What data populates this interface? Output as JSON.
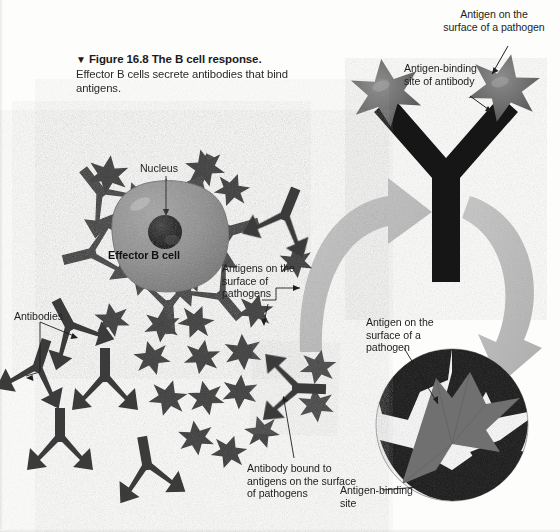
{
  "figure": {
    "marker": "▼",
    "number": "Figure 16.8",
    "title": "The B cell response.",
    "subtitle": "Effector B cells secrete antibodies that bind antigens."
  },
  "labels": {
    "nucleus": "Nucleus",
    "effector_b_cell": "Effector B cell",
    "antigens_on_surface_of_pathogens": "Antigens on the surface of pathogens",
    "antibodies": "Antibodies",
    "antibody_bound": "Antibody bound to antigens on the surface of pathogens",
    "antigen_on_surface_top": "Antigen on the surface of a pathogen",
    "antigen_binding_site_of_antibody": "Antigen-binding site of antibody",
    "antigen_on_surface_bottom": "Antigen on the surface of a pathogen",
    "antigen_binding_site": "Antigen-binding site"
  },
  "colors": {
    "background": "#fdfdfc",
    "antibody_dark": "#3a3a3a",
    "antibody_black": "#141414",
    "antigen_star_dark": "#3d3d3d",
    "antigen_star_gray": "#6e6e6e",
    "cell_body": "#8d8d8d",
    "cell_nucleus": "#1a1a1a",
    "arrow_gray": "#b9b9b9",
    "leader_line": "#1e1e1e",
    "text": "#1e1e1e"
  },
  "diagram": {
    "type": "biology-illustration",
    "panels": [
      {
        "name": "cell-panel",
        "description": "Effector B cell secreting antibodies among pathogen antigens"
      },
      {
        "name": "antibody-detail-panel",
        "description": "Enlarged Y-shaped antibody with two antigens bound at its tips"
      },
      {
        "name": "binding-site-panel",
        "description": "Circular magnification of an antigen-binding site"
      }
    ],
    "antigen_stars": [
      {
        "cx": 108,
        "cy": 175,
        "r": 20,
        "shade": "dark"
      },
      {
        "cx": 205,
        "cy": 168,
        "r": 19,
        "shade": "dark"
      },
      {
        "cx": 232,
        "cy": 190,
        "r": 17,
        "shade": "dark"
      },
      {
        "cx": 296,
        "cy": 262,
        "r": 16,
        "shade": "dark"
      },
      {
        "cx": 255,
        "cy": 311,
        "r": 17,
        "shade": "dark"
      },
      {
        "cx": 112,
        "cy": 320,
        "r": 17,
        "shade": "dark"
      },
      {
        "cx": 162,
        "cy": 325,
        "r": 17,
        "shade": "dark"
      },
      {
        "cx": 196,
        "cy": 322,
        "r": 17,
        "shade": "dark"
      },
      {
        "cx": 152,
        "cy": 358,
        "r": 17,
        "shade": "dark"
      },
      {
        "cx": 202,
        "cy": 357,
        "r": 17,
        "shade": "dark"
      },
      {
        "cx": 243,
        "cy": 352,
        "r": 18,
        "shade": "dark"
      },
      {
        "cx": 168,
        "cy": 398,
        "r": 18,
        "shade": "dark"
      },
      {
        "cx": 206,
        "cy": 398,
        "r": 17,
        "shade": "dark"
      },
      {
        "cx": 240,
        "cy": 392,
        "r": 17,
        "shade": "dark"
      },
      {
        "cx": 196,
        "cy": 438,
        "r": 17,
        "shade": "dark"
      },
      {
        "cx": 229,
        "cy": 452,
        "r": 17,
        "shade": "dark"
      },
      {
        "cx": 262,
        "cy": 432,
        "r": 16,
        "shade": "dark"
      },
      {
        "cx": 318,
        "cy": 367,
        "r": 17,
        "shade": "dark"
      },
      {
        "cx": 316,
        "cy": 405,
        "r": 17,
        "shade": "dark"
      },
      {
        "cx": 386,
        "cy": 93,
        "r": 34,
        "shade": "gray"
      },
      {
        "cx": 504,
        "cy": 88,
        "r": 34,
        "shade": "gray"
      }
    ],
    "free_antibodies": [
      {
        "x": 72,
        "y": 330,
        "rot": -28
      },
      {
        "x": 36,
        "y": 372,
        "rot": 18
      },
      {
        "x": 105,
        "y": 382,
        "rot": 0
      },
      {
        "x": 60,
        "y": 442,
        "rot": 0
      },
      {
        "x": 148,
        "y": 470,
        "rot": -10
      },
      {
        "x": 283,
        "y": 220,
        "rot": 22
      }
    ]
  }
}
